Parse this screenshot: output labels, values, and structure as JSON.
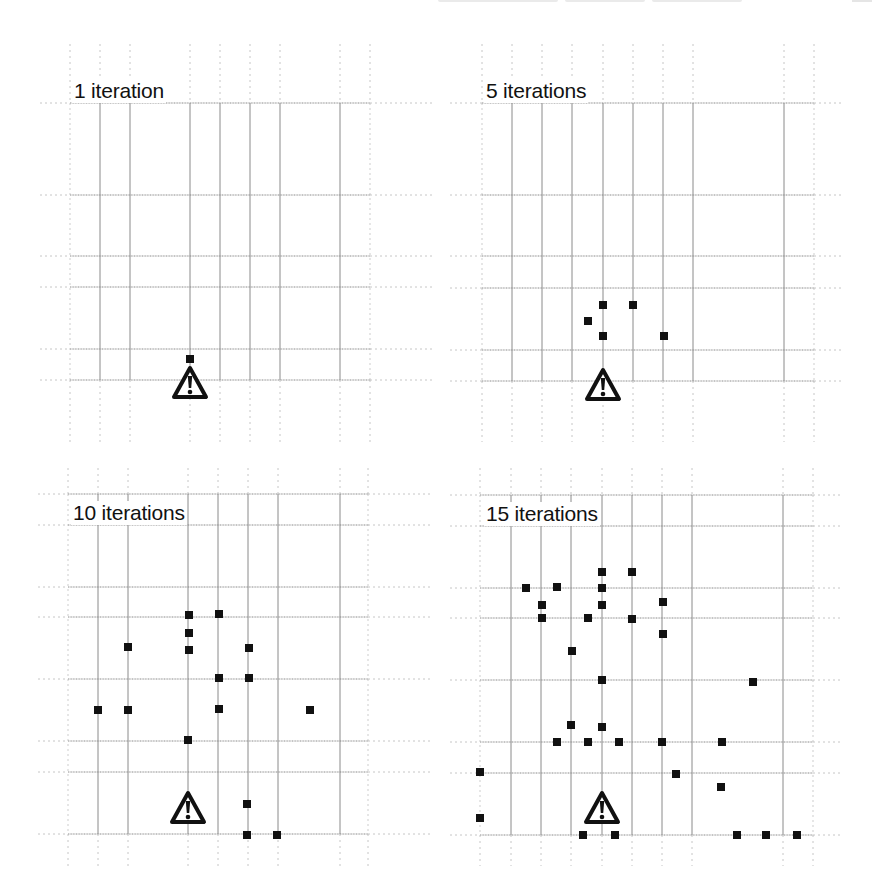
{
  "figure": {
    "panels": [
      {
        "id": "tl",
        "title": "1 iteration",
        "iterations": 1,
        "origin": [
          0,
          0
        ],
        "h_lines": [
          103,
          195,
          256,
          287,
          349,
          380
        ],
        "v_lines": [
          70,
          100,
          130,
          190,
          220,
          250,
          280,
          340,
          370
        ],
        "h_extent": [
          40,
          432
        ],
        "v_extent": [
          44,
          442
        ],
        "warning_icon": [
          190,
          383
        ],
        "markers": [
          [
            190,
            359
          ]
        ]
      },
      {
        "id": "tr",
        "title": "5 iterations",
        "iterations": 5,
        "origin": [
          0,
          0
        ],
        "h_lines": [
          103,
          195,
          256,
          288,
          350,
          381
        ],
        "v_lines": [
          482,
          512,
          542,
          572,
          603,
          633,
          663,
          693,
          784,
          814
        ],
        "h_extent": [
          450,
          842
        ],
        "v_extent": [
          44,
          442
        ],
        "warning_icon": [
          603,
          385
        ],
        "markers": [
          [
            603,
            305
          ],
          [
            633,
            305
          ],
          [
            588,
            321
          ],
          [
            603,
            336
          ],
          [
            664,
            336
          ]
        ]
      },
      {
        "id": "bl",
        "title": "10 iterations",
        "iterations": 10,
        "origin": [
          0,
          0
        ],
        "h_lines": [
          494,
          525,
          587,
          617,
          679,
          741,
          772,
          834
        ],
        "v_lines": [
          68,
          98,
          128,
          188,
          218,
          248,
          278,
          340,
          368
        ],
        "h_extent": [
          38,
          432
        ],
        "v_extent": [
          468,
          866
        ],
        "warning_icon": [
          188,
          808
        ],
        "markers": [
          [
            189,
            615
          ],
          [
            219,
            614
          ],
          [
            189,
            633
          ],
          [
            128,
            647
          ],
          [
            189,
            650
          ],
          [
            249,
            648
          ],
          [
            219,
            678
          ],
          [
            249,
            678
          ],
          [
            98,
            710
          ],
          [
            128,
            710
          ],
          [
            219,
            709
          ],
          [
            310,
            710
          ],
          [
            188,
            740
          ],
          [
            247,
            804
          ],
          [
            247,
            835
          ],
          [
            277,
            835
          ]
        ]
      },
      {
        "id": "br",
        "title": "15 iterations",
        "iterations": 15,
        "origin": [
          0,
          0
        ],
        "h_lines": [
          495,
          526,
          588,
          618,
          680,
          742,
          773,
          835
        ],
        "v_lines": [
          480,
          511,
          541,
          571,
          602,
          632,
          662,
          692,
          783,
          813
        ],
        "h_extent": [
          450,
          842
        ],
        "v_extent": [
          468,
          866
        ],
        "warning_icon": [
          602,
          808
        ],
        "markers": [
          [
            602,
            572
          ],
          [
            632,
            572
          ],
          [
            526,
            588
          ],
          [
            557,
            587
          ],
          [
            602,
            588
          ],
          [
            542,
            605
          ],
          [
            602,
            605
          ],
          [
            663,
            602
          ],
          [
            542,
            618
          ],
          [
            588,
            618
          ],
          [
            632,
            619
          ],
          [
            663,
            634
          ],
          [
            572,
            651
          ],
          [
            602,
            680
          ],
          [
            753,
            682
          ],
          [
            571,
            725
          ],
          [
            602,
            727
          ],
          [
            557,
            742
          ],
          [
            588,
            742
          ],
          [
            619,
            742
          ],
          [
            662,
            742
          ],
          [
            722,
            742
          ],
          [
            480,
            772
          ],
          [
            676,
            774
          ],
          [
            721,
            787
          ],
          [
            480,
            818
          ],
          [
            583,
            835
          ],
          [
            615,
            835
          ],
          [
            737,
            835
          ],
          [
            766,
            835
          ],
          [
            797,
            835
          ]
        ]
      }
    ]
  },
  "colors": {
    "grid_line": "#8a8a8a",
    "grid_dash": "#b8b8b8",
    "marker": "#111111",
    "warning_icon": "#111111",
    "text": "#111111"
  }
}
